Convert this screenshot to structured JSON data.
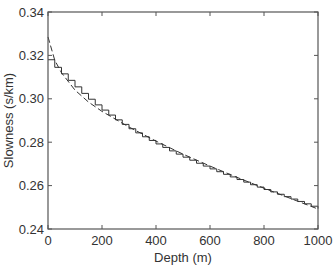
{
  "chart_data": {
    "type": "line",
    "title": "",
    "xlabel": "Depth (m)",
    "ylabel": "Slowness (s/km)",
    "xlim": [
      0,
      1000
    ],
    "ylim": [
      0.24,
      0.34
    ],
    "xticks": [
      0,
      200,
      400,
      600,
      800,
      1000
    ],
    "yticks": [
      0.24,
      0.26,
      0.28,
      0.3,
      0.32,
      0.34
    ],
    "xtick_labels": [
      "0",
      "200",
      "400",
      "600",
      "800",
      "1000"
    ],
    "ytick_labels": [
      "0.24",
      "0.26",
      "0.28",
      "0.30",
      "0.32",
      "0.34"
    ],
    "grid": false,
    "legend": null,
    "series": [
      {
        "name": "smooth (dashed)",
        "style": "dashed",
        "x": [
          0,
          25,
          50,
          100,
          150,
          200,
          300,
          400,
          500,
          600,
          700,
          800,
          900,
          1000
        ],
        "values": [
          0.3285,
          0.3178,
          0.312,
          0.304,
          0.2985,
          0.2942,
          0.287,
          0.2805,
          0.2745,
          0.269,
          0.2638,
          0.2588,
          0.254,
          0.2492
        ]
      },
      {
        "name": "layered (staircase)",
        "style": "solid-step",
        "x": [
          0,
          25,
          50,
          75,
          100,
          125,
          150,
          175,
          200,
          225,
          250,
          275,
          300,
          325,
          350,
          375,
          400,
          425,
          450,
          475,
          500,
          525,
          550,
          575,
          600,
          625,
          650,
          675,
          700,
          725,
          750,
          775,
          800,
          825,
          850,
          875,
          900,
          925,
          950,
          975,
          1000
        ],
        "values": [
          0.318,
          0.3145,
          0.3115,
          0.3085,
          0.3055,
          0.3025,
          0.2998,
          0.2972,
          0.2948,
          0.2925,
          0.2903,
          0.2882,
          0.2862,
          0.2843,
          0.2825,
          0.2808,
          0.2792,
          0.2776,
          0.276,
          0.2745,
          0.2731,
          0.2717,
          0.2703,
          0.269,
          0.2677,
          0.2664,
          0.2652,
          0.264,
          0.2628,
          0.2616,
          0.2604,
          0.2593,
          0.2582,
          0.2571,
          0.256,
          0.2549,
          0.2538,
          0.2527,
          0.2516,
          0.2505,
          0.2494
        ]
      }
    ]
  },
  "axes": {
    "xlabel": "Depth (m)",
    "ylabel": "Slowness (s/km)"
  },
  "colors": {
    "axis": "#555555",
    "line": "#333333",
    "text": "#333333"
  }
}
